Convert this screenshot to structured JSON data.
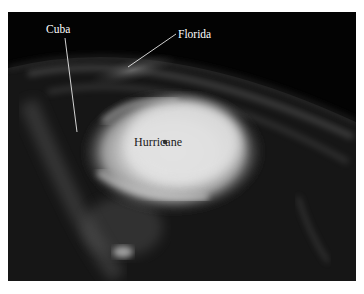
{
  "figure": {
    "labels": {
      "cuba": "Cuba",
      "florida": "Florida",
      "hurricane": "Hurricane"
    }
  }
}
